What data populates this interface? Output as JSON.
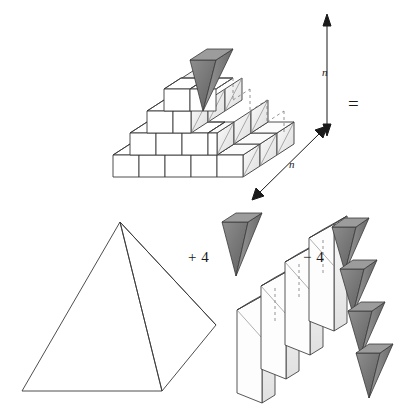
{
  "figure": {
    "background_color": "#ffffff",
    "stroke_color": "#3a3a3a",
    "labels": {
      "equals": "=",
      "plus_four": "+ 4",
      "minus_four": "− 4",
      "n_vertical": "n",
      "n_diagonal": "n"
    },
    "colors": {
      "outline": "#3a3a3a",
      "face_light": "#ffffff",
      "face_shade": "#eeeeee",
      "face_shade_2": "#e2e2e2",
      "wedge_dark": "#7a7a7a",
      "wedge_dark_2": "#6a6a6a",
      "wedge_mid": "#8c8c8c",
      "dashed": "#6e6e6e"
    },
    "parts": [
      {
        "name": "stepped-pyramid",
        "description": "Staircase solid of unit cubes, 4 levels, square n by n base",
        "levels": 4,
        "base_cubes_per_side": 4,
        "top_wedge_count": 1
      },
      {
        "name": "smooth-pyramid",
        "description": "Wireframe square pyramid in oblique projection",
        "faces": 4
      },
      {
        "name": "staircase-slabs",
        "description": "Four thin vertical slabs arranged as a descending staircase",
        "count": 4
      },
      {
        "name": "dark-wedges",
        "description": "Four inverted dark triangular prisms in a diagonal column",
        "count": 4
      }
    ],
    "dimension_arrows": [
      {
        "name": "vertical-height",
        "label": "n",
        "orientation": "vertical"
      },
      {
        "name": "diagonal-depth",
        "label": "n",
        "orientation": "diagonal"
      }
    ]
  }
}
